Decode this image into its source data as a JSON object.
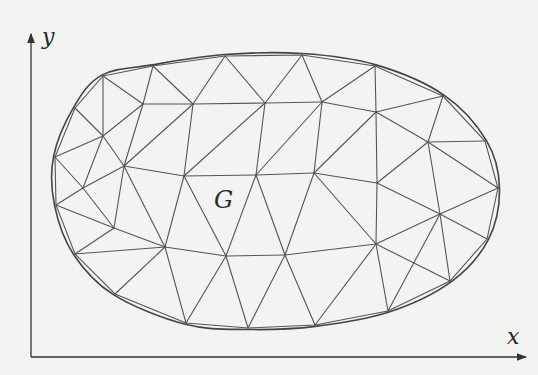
{
  "figure": {
    "region_label": "G",
    "x_axis_label": "x",
    "y_axis_label": "y",
    "line_color": "#555555",
    "boundary_color": "#444444",
    "background": "#f3f3f1"
  },
  "axes": {
    "origin": [
      31,
      357
    ],
    "x_end": [
      526,
      357
    ],
    "y_end": [
      31,
      34
    ]
  },
  "mesh": {
    "boundary": [
      [
        103,
        76
      ],
      [
        153,
        66
      ],
      [
        225,
        56
      ],
      [
        302,
        55
      ],
      [
        375,
        66
      ],
      [
        443,
        96
      ],
      [
        485,
        141
      ],
      [
        498,
        188
      ],
      [
        487,
        239
      ],
      [
        450,
        281
      ],
      [
        388,
        311
      ],
      [
        315,
        325
      ],
      [
        248,
        328
      ],
      [
        186,
        323
      ],
      [
        115,
        294
      ],
      [
        75,
        254
      ],
      [
        56,
        205
      ],
      [
        55,
        157
      ],
      [
        75,
        108
      ]
    ],
    "interior": {
      "i0": [
        143,
        104
      ],
      "i1": [
        193,
        104
      ],
      "i2": [
        265,
        103
      ],
      "i3": [
        322,
        102
      ],
      "i4": [
        376,
        112
      ],
      "i5": [
        428,
        142
      ],
      "i6": [
        103,
        136
      ],
      "i7": [
        124,
        166
      ],
      "i8": [
        83,
        188
      ],
      "i9": [
        184,
        176
      ],
      "i10": [
        256,
        175
      ],
      "i11": [
        314,
        173
      ],
      "i12": [
        377,
        183
      ],
      "i13": [
        440,
        214
      ],
      "i14": [
        114,
        228
      ],
      "i15": [
        165,
        247
      ],
      "i16": [
        226,
        256
      ],
      "i17": [
        285,
        255
      ],
      "i18": [
        376,
        244
      ]
    },
    "edges": [
      [
        "b0",
        "i0"
      ],
      [
        "b0",
        "i6"
      ],
      [
        "b1",
        "i0"
      ],
      [
        "b1",
        "i1"
      ],
      [
        "b2",
        "i1"
      ],
      [
        "b2",
        "i2"
      ],
      [
        "b3",
        "i2"
      ],
      [
        "b3",
        "i3"
      ],
      [
        "b4",
        "i3"
      ],
      [
        "b4",
        "i4"
      ],
      [
        "b5",
        "i4"
      ],
      [
        "b5",
        "i5"
      ],
      [
        "b6",
        "i5"
      ],
      [
        "b7",
        "i5"
      ],
      [
        "b7",
        "i13"
      ],
      [
        "b8",
        "i13"
      ],
      [
        "i0",
        "i1"
      ],
      [
        "i1",
        "i2"
      ],
      [
        "i2",
        "i3"
      ],
      [
        "i3",
        "i4"
      ],
      [
        "i4",
        "i5"
      ],
      [
        "i0",
        "i6"
      ],
      [
        "i6",
        "b18"
      ],
      [
        "i6",
        "b17"
      ],
      [
        "i6",
        "i7"
      ],
      [
        "i0",
        "i7"
      ],
      [
        "i1",
        "i7"
      ],
      [
        "i6",
        "i8"
      ],
      [
        "b17",
        "i8"
      ],
      [
        "i8",
        "i7"
      ],
      [
        "i8",
        "b16"
      ],
      [
        "i8",
        "i14"
      ],
      [
        "i7",
        "i9"
      ],
      [
        "i1",
        "i9"
      ],
      [
        "i2",
        "i9"
      ],
      [
        "i2",
        "i10"
      ],
      [
        "i3",
        "i10"
      ],
      [
        "i3",
        "i11"
      ],
      [
        "i4",
        "i11"
      ],
      [
        "i4",
        "i12"
      ],
      [
        "i5",
        "i12"
      ],
      [
        "i5",
        "i13"
      ],
      [
        "i9",
        "i10"
      ],
      [
        "i10",
        "i11"
      ],
      [
        "i11",
        "i12"
      ],
      [
        "i12",
        "i13"
      ],
      [
        "i7",
        "i14"
      ],
      [
        "i7",
        "i15"
      ],
      [
        "i9",
        "i15"
      ],
      [
        "i9",
        "i16"
      ],
      [
        "i10",
        "i16"
      ],
      [
        "i10",
        "i17"
      ],
      [
        "i11",
        "i17"
      ],
      [
        "i11",
        "i18"
      ],
      [
        "i12",
        "i18"
      ],
      [
        "i13",
        "i18"
      ],
      [
        "i14",
        "b16"
      ],
      [
        "i14",
        "b15"
      ],
      [
        "i14",
        "i15"
      ],
      [
        "i15",
        "b15"
      ],
      [
        "i15",
        "b14"
      ],
      [
        "i15",
        "i16"
      ],
      [
        "i16",
        "i17"
      ],
      [
        "i17",
        "i18"
      ],
      [
        "i15",
        "b13"
      ],
      [
        "i16",
        "b13"
      ],
      [
        "i16",
        "b12"
      ],
      [
        "i17",
        "b12"
      ],
      [
        "i17",
        "b11"
      ],
      [
        "i18",
        "b11"
      ],
      [
        "i18",
        "b10"
      ],
      [
        "i13",
        "b10"
      ],
      [
        "i13",
        "b9"
      ],
      [
        "i18",
        "b9"
      ]
    ]
  }
}
